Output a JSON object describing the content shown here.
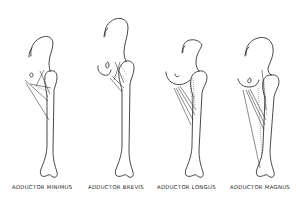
{
  "diagram": {
    "figures": [
      {
        "id": "adductor-minimus",
        "label": "ADDUCTOR MINIMUS"
      },
      {
        "id": "adductor-brevis",
        "label": "ADDUCTOR BREVIS"
      },
      {
        "id": "adductor-longus",
        "label": "ADDUCTOR LONGUS"
      },
      {
        "id": "adductor-magnus",
        "label": "ADDUCTOR MAGNUS"
      }
    ]
  }
}
